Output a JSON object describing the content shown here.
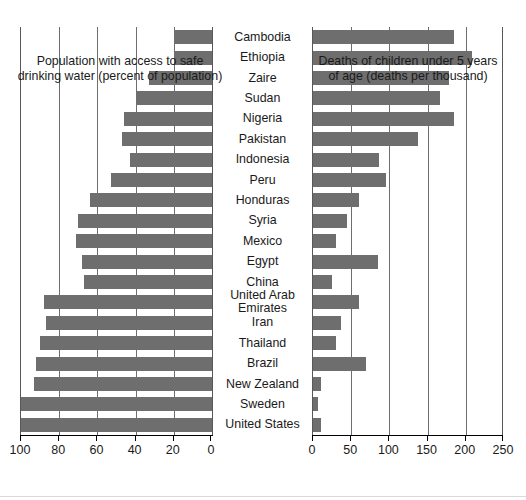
{
  "chart_data": [
    {
      "type": "bar",
      "orientation": "horizontal",
      "id": "water-access",
      "title": "",
      "xlabel": "Population with access to safe\ndrinking water (percent of population)",
      "ylabel": "",
      "xlim": [
        100,
        0
      ],
      "reversed_axis": true,
      "ticks": [
        100,
        80,
        60,
        40,
        20,
        0
      ],
      "ticklabels": [
        "100",
        "80",
        "60",
        "40",
        "20",
        "0"
      ],
      "grid": true,
      "legend": "none",
      "bar_color": "#6e6e6e",
      "categories": [
        "Cambodia",
        "Ethiopia",
        "Zaire",
        "Sudan",
        "Nigeria",
        "Pakistan",
        "Indonesia",
        "Peru",
        "Honduras",
        "Syria",
        "Mexico",
        "Egypt",
        "China",
        "United Arab Emirates",
        "Iran",
        "Thailand",
        "Brazil",
        "New Zealand",
        "Sweden",
        "United States"
      ],
      "values": [
        20,
        20,
        33,
        40,
        46,
        47,
        43,
        53,
        64,
        70,
        71,
        68,
        67,
        88,
        87,
        90,
        92,
        93,
        100,
        100
      ]
    },
    {
      "type": "bar",
      "orientation": "horizontal",
      "id": "under-five-mortality",
      "title": "",
      "xlabel": "Deaths of children under 5 years\nof age (deaths per thousand)",
      "ylabel": "",
      "xlim": [
        0,
        250
      ],
      "reversed_axis": false,
      "ticks": [
        0,
        50,
        100,
        150,
        200,
        250
      ],
      "ticklabels": [
        "0",
        "50",
        "100",
        "150",
        "200",
        "250"
      ],
      "grid": true,
      "legend": "none",
      "bar_color": "#6e6e6e",
      "categories": [
        "Cambodia",
        "Ethiopia",
        "Zaire",
        "Sudan",
        "Nigeria",
        "Pakistan",
        "Indonesia",
        "Peru",
        "Honduras",
        "Syria",
        "Mexico",
        "Egypt",
        "China",
        "United Arab Emirates",
        "Iran",
        "Thailand",
        "Brazil",
        "New Zealand",
        "Sweden",
        "United States"
      ],
      "values": [
        184,
        208,
        178,
        166,
        184,
        137,
        86,
        96,
        60,
        44,
        30,
        85,
        25,
        60,
        37,
        30,
        70,
        11,
        6,
        10
      ]
    }
  ],
  "left_panel": {
    "axis_title": "Population with access to safe\ndrinking water (percent of population)",
    "ticklabels": [
      "100",
      "80",
      "60",
      "40",
      "20",
      "0"
    ]
  },
  "right_panel": {
    "axis_title": "Deaths of children under 5 years\nof age (deaths per thousand)",
    "ticklabels": [
      "0",
      "50",
      "100",
      "150",
      "200",
      "250"
    ]
  },
  "categories": [
    "Cambodia",
    "Ethiopia",
    "Zaire",
    "Sudan",
    "Nigeria",
    "Pakistan",
    "Indonesia",
    "Peru",
    "Honduras",
    "Syria",
    "Mexico",
    "Egypt",
    "China",
    "United Arab\nEmirates",
    "Iran",
    "Thailand",
    "Brazil",
    "New Zealand",
    "Sweden",
    "United States"
  ]
}
